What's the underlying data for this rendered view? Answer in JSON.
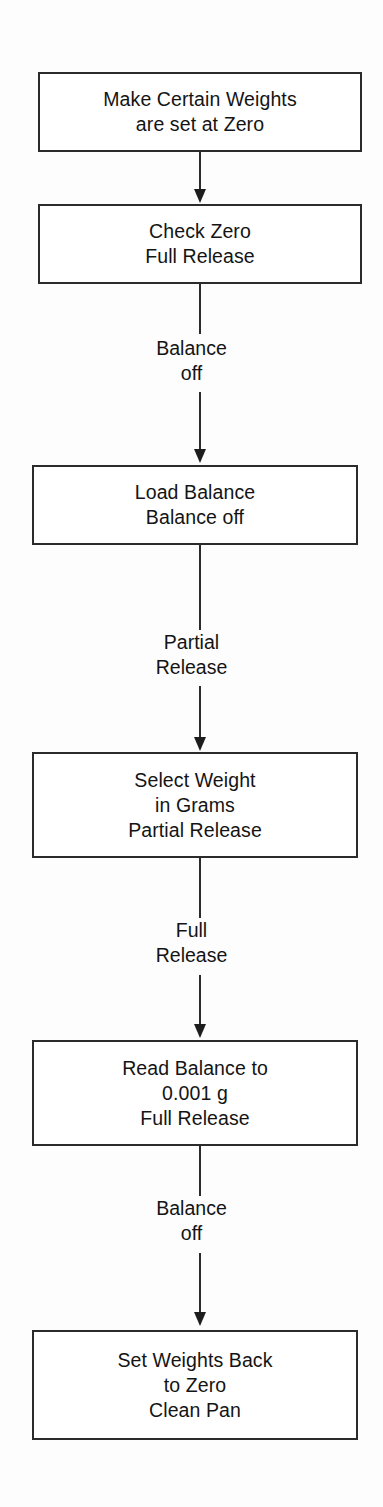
{
  "diagram": {
    "type": "flowchart",
    "orientation": "top-to-bottom",
    "colors": {
      "background": "#fdfdfd",
      "box_fill": "#ffffff",
      "box_border": "#2b2b2b",
      "text": "#141414",
      "connector": "#2b2b2b"
    },
    "nodes": [
      {
        "id": "make-certain-weights-zero",
        "lines": [
          "Make Certain Weights",
          "are set at Zero"
        ]
      },
      {
        "id": "check-zero",
        "lines": [
          "Check Zero",
          "Full Release"
        ]
      },
      {
        "id": "load-balance",
        "lines": [
          "Load Balance",
          "Balance off"
        ]
      },
      {
        "id": "select-weight",
        "lines": [
          "Select Weight",
          "in Grams",
          "Partial Release"
        ]
      },
      {
        "id": "read-balance",
        "lines": [
          "Read Balance to",
          "0.001 g",
          "Full Release"
        ]
      },
      {
        "id": "set-weights-back",
        "lines": [
          "Set Weights Back",
          "to Zero",
          "Clean Pan"
        ]
      }
    ],
    "edges": [
      {
        "id": "edge-1",
        "from": "make-certain-weights-zero",
        "to": "check-zero",
        "lines": []
      },
      {
        "id": "edge-2",
        "from": "check-zero",
        "to": "load-balance",
        "lines": [
          "Balance",
          "off"
        ]
      },
      {
        "id": "edge-3",
        "from": "load-balance",
        "to": "select-weight",
        "lines": [
          "Partial",
          "Release"
        ]
      },
      {
        "id": "edge-4",
        "from": "select-weight",
        "to": "read-balance",
        "lines": [
          "Full",
          "Release"
        ]
      },
      {
        "id": "edge-5",
        "from": "read-balance",
        "to": "set-weights-back",
        "lines": [
          "Balance",
          "off"
        ]
      }
    ]
  }
}
